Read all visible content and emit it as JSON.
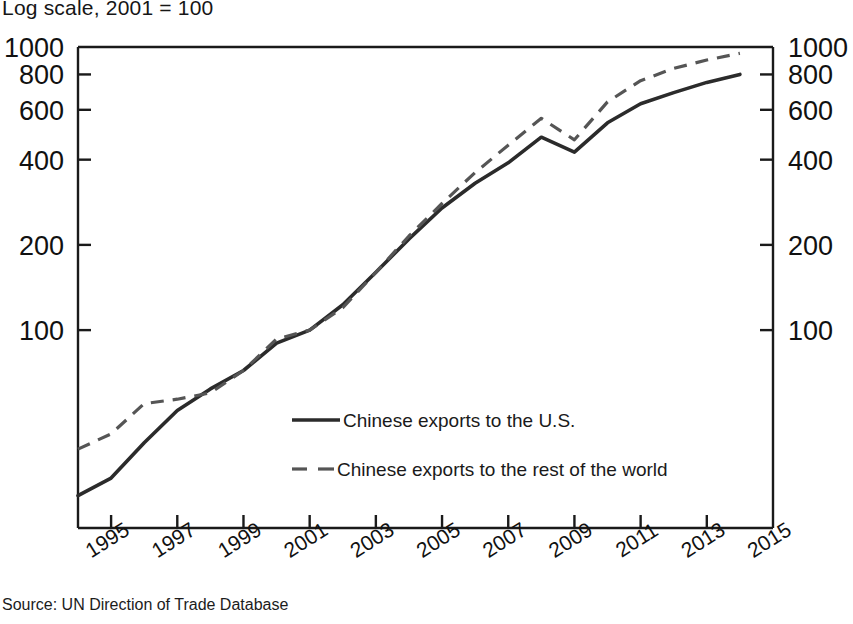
{
  "subtitle": "Log scale, 2001 = 100",
  "source_note": "Source: UN Direction of Trade Database",
  "axes": {
    "y_left_ticks": [
      "1000",
      "800",
      "600",
      "400",
      "200",
      "100"
    ],
    "y_right_ticks": [
      "1000",
      "800",
      "600",
      "400",
      "200",
      "100"
    ],
    "x_ticks": [
      "1995",
      "1997",
      "1999",
      "2001",
      "2003",
      "2005",
      "2007",
      "2009",
      "2011",
      "2013",
      "2015"
    ]
  },
  "legend": {
    "series_1_label": "Chinese exports to the U.S.",
    "series_2_label": "Chinese exports to the rest of the world"
  },
  "colors": {
    "line_solid": "#2b2b2b",
    "line_dashed": "#555555",
    "axis": "#1a1a1a",
    "background": "#ffffff"
  },
  "chart_data": {
    "type": "line",
    "title": "",
    "subtitle": "Log scale, 2001 = 100",
    "xlabel": "",
    "ylabel": "",
    "yscale": "log",
    "ylim": [
      20,
      1000
    ],
    "xlim": [
      1994,
      2015
    ],
    "grid": false,
    "legend_position": "inside-center-lower",
    "ytick_values": [
      100,
      200,
      400,
      600,
      800,
      1000
    ],
    "xtick_values": [
      1995,
      1997,
      1999,
      2001,
      2003,
      2005,
      2007,
      2009,
      2011,
      2013,
      2015
    ],
    "x": [
      1994,
      1995,
      1996,
      1997,
      1998,
      1999,
      2000,
      2001,
      2002,
      2003,
      2004,
      2005,
      2006,
      2007,
      2008,
      2009,
      2010,
      2011,
      2012,
      2013,
      2014
    ],
    "series": [
      {
        "name": "Chinese exports to the U.S.",
        "style": "solid",
        "values": [
          26,
          30,
          40,
          52,
          62,
          72,
          90,
          100,
          123,
          160,
          210,
          270,
          330,
          390,
          480,
          425,
          540,
          630,
          690,
          750,
          800
        ]
      },
      {
        "name": "Chinese exports to the rest of the world",
        "style": "dashed",
        "values": [
          38,
          43,
          55,
          57,
          60,
          72,
          93,
          100,
          120,
          160,
          215,
          280,
          360,
          450,
          560,
          470,
          640,
          760,
          840,
          900,
          950
        ]
      }
    ],
    "annotations": [
      "Solid line peaks near 480 in 2008, dips to about 425 in 2009",
      "Dashed line peaks near 560 in 2008, dips to about 470 in 2009"
    ]
  }
}
